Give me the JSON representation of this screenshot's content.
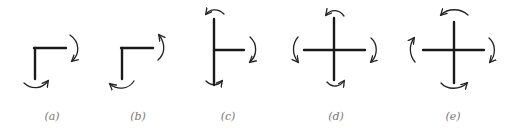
{
  "figure": {
    "panels": [
      {
        "id": "a",
        "label": "(a)",
        "shape": "L-joint",
        "members": [
          "down",
          "right"
        ],
        "moments": [
          "right-cw",
          "bottom-ccw"
        ]
      },
      {
        "id": "b",
        "label": "(b)",
        "shape": "L-joint",
        "members": [
          "down",
          "right"
        ],
        "moments": [
          "right-ccw",
          "bottom-cw"
        ]
      },
      {
        "id": "c",
        "label": "(c)",
        "shape": "T-joint",
        "members": [
          "up",
          "down",
          "right"
        ],
        "moments": [
          "top-ccw",
          "right-cw",
          "bottom-ccw"
        ]
      },
      {
        "id": "d",
        "label": "(d)",
        "shape": "cross-joint",
        "members": [
          "up",
          "down",
          "left",
          "right"
        ],
        "moments": [
          "top-ccw",
          "left-ccw",
          "right-cw",
          "bottom-ccw"
        ]
      },
      {
        "id": "e",
        "label": "(e)",
        "shape": "cross-joint",
        "members": [
          "up",
          "down",
          "left",
          "right"
        ],
        "moments": [
          "top-ccw",
          "left-cw",
          "right-cw",
          "bottom-ccw"
        ]
      }
    ],
    "colors": {
      "line": "#1a1a1a",
      "label": "#777777",
      "background": "#ffffff"
    }
  }
}
